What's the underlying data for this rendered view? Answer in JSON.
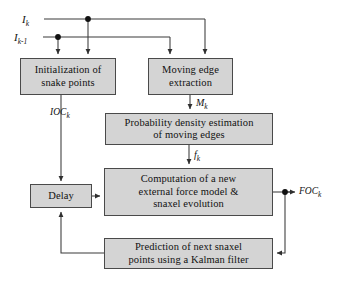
{
  "diagram": {
    "nodes": {
      "initialization": "Initialization of snake points",
      "moving_edge": "Moving edge extraction",
      "probability": "Probability density estimation of moving edges",
      "computation": "Computation of a new external force model & snaxel evolution",
      "delay": "Delay",
      "kalman": "Prediction of next snaxel points using a  Kalman filter"
    },
    "node_lines": {
      "initialization": [
        "Initialization of",
        "snake points"
      ],
      "moving_edge": [
        "Moving edge",
        "extraction"
      ],
      "probability": [
        "Probability density estimation",
        "of moving edges"
      ],
      "computation": [
        "Computation of a new",
        "external force model &",
        "snaxel evolution"
      ],
      "delay": [
        "Delay"
      ],
      "kalman": [
        "Prediction of next snaxel",
        "points using a  Kalman filter"
      ]
    },
    "signals": {
      "i_k": "I",
      "i_k_sub": "k",
      "i_k1": "I",
      "i_k1_sub": "k-1",
      "m_k": "M",
      "m_k_sub": "k",
      "f_k": "f",
      "f_k_sub": "k",
      "ioc_k": "IOC",
      "ioc_k_sub": "k",
      "foc_k": "FOC",
      "foc_k_sub": "k"
    },
    "colors": {
      "node_fill": "#d4d4d4",
      "node_border": "#4a4a4a",
      "wire": "#3a3a3a",
      "background": "#ffffff"
    }
  }
}
